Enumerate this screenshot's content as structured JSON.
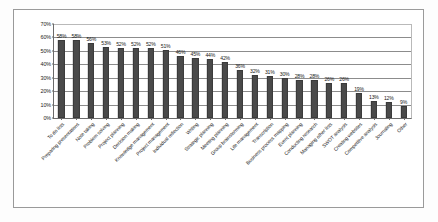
{
  "chart_data": {
    "type": "bar",
    "title": "",
    "xlabel": "",
    "ylabel": "",
    "ylim": [
      0,
      70
    ],
    "grid": true,
    "legend": false,
    "ytick_labels": [
      "70%",
      "60%",
      "50%",
      "40%",
      "30%",
      "20%",
      "10%",
      "0%"
    ],
    "ytick_values": [
      70,
      60,
      50,
      40,
      30,
      20,
      10,
      0
    ],
    "value_suffix": "%",
    "bar_color": "#4a4a4a",
    "categories": [
      "To do lists",
      "Preparing presentations",
      "Note taking",
      "Problem solving",
      "Project planning",
      "Decision making",
      "Knowledge management",
      "Project management",
      "Individual reflection",
      "Writing",
      "Strategic planning",
      "Meeting planning",
      "Group brainstorming",
      "Life management",
      "Transcription",
      "Business process mapping",
      "Event planning",
      "Conducting research",
      "Managing other lists",
      "SWOT analysis",
      "Creating websites",
      "Competitive analysis",
      "Journaling",
      "Other"
    ],
    "values": [
      58,
      58,
      56,
      53,
      52,
      52,
      52,
      51,
      46,
      45,
      44,
      42,
      36,
      32,
      31,
      30,
      28,
      28,
      26,
      26,
      19,
      13,
      12,
      9
    ],
    "value_labels": [
      "58%",
      "58%",
      "56%",
      "53%",
      "52%",
      "52%",
      "52%",
      "51%",
      "46%",
      "45%",
      "44%",
      "42%",
      "36%",
      "32%",
      "31%",
      "30%",
      "28%",
      "28%",
      "26%",
      "26%",
      "19%",
      "13%",
      "12%",
      "9%"
    ]
  }
}
